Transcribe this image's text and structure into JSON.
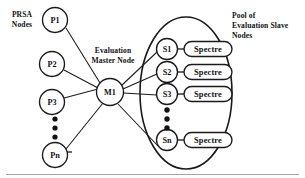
{
  "diagram": {
    "background_color": "#ffffff",
    "stroke_color": "#1a1a1a",
    "captions": {
      "prsa": {
        "line1": "PRSA",
        "line2": "Nodes"
      },
      "master": {
        "line1": "Evaluation",
        "line2": "Master Node"
      },
      "pool": {
        "line1": "Pool of",
        "line2": "Evaluation Slave",
        "line3": "Nodes"
      }
    },
    "prsa_nodes": [
      {
        "label": "P1",
        "cx": 55,
        "cy": 20,
        "r": 12.5
      },
      {
        "label": "P2",
        "cx": 52,
        "cy": 64,
        "r": 12.5
      },
      {
        "label": "P3",
        "cx": 52,
        "cy": 102,
        "r": 12.5
      },
      {
        "label": "Pn",
        "cx": 55,
        "cy": 155,
        "r": 12.5,
        "italic_suffix": true
      }
    ],
    "prsa_ellipsis_dots": [
      {
        "cx": 55,
        "cy": 119,
        "r": 2.6
      },
      {
        "cx": 55,
        "cy": 128,
        "r": 2.6
      },
      {
        "cx": 55,
        "cy": 137,
        "r": 2.6
      }
    ],
    "master_node": {
      "label": "M1",
      "cx": 110,
      "cy": 92,
      "r": 13.5
    },
    "slave_nodes": [
      {
        "label": "S1",
        "cx": 167,
        "cy": 49,
        "r": 10.5,
        "spectre": "Spectre"
      },
      {
        "label": "S2",
        "cx": 167,
        "cy": 72,
        "r": 10.5,
        "spectre": "Spectre"
      },
      {
        "label": "S3",
        "cx": 167,
        "cy": 94,
        "r": 10.5,
        "spectre": "Spectre"
      },
      {
        "label": "Sn",
        "cx": 167,
        "cy": 140,
        "r": 10.5,
        "spectre": "Spectre",
        "italic_suffix": true
      }
    ],
    "slave_ellipsis_dots": [
      {
        "cx": 167,
        "cy": 110,
        "r": 2.7
      },
      {
        "cx": 167,
        "cy": 119,
        "r": 2.7
      },
      {
        "cx": 167,
        "cy": 128,
        "r": 2.7
      }
    ],
    "spectre_box": {
      "x": 184,
      "width": 48,
      "height": 15,
      "rx": 7.5
    },
    "pool_ellipse": {
      "cx": 186,
      "cy": 93,
      "rx": 46,
      "ry": 76
    }
  }
}
